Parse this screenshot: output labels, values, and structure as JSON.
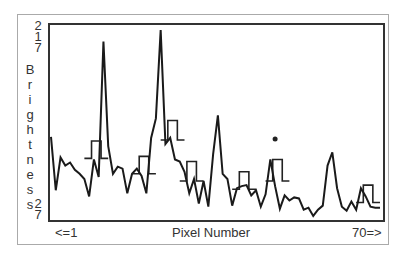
{
  "chart_data": {
    "type": "line",
    "title": "",
    "xlabel": "Pixel Number",
    "ylabel": "Brightness",
    "x_range_labels": {
      "min": "<=1",
      "max": "70=>"
    },
    "y_range_labels": {
      "max": "217",
      "min": "27"
    },
    "ylim": [
      27,
      217
    ],
    "xlim": [
      1,
      70
    ],
    "grid": false,
    "legend": null,
    "series": [
      {
        "name": "brightness",
        "x": [
          1,
          2,
          3,
          4,
          5,
          6,
          7,
          8,
          9,
          10,
          11,
          12,
          13,
          14,
          15,
          16,
          17,
          18,
          19,
          20,
          21,
          22,
          23,
          24,
          25,
          26,
          27,
          28,
          29,
          30,
          31,
          32,
          33,
          34,
          35,
          36,
          37,
          38,
          39,
          40,
          41,
          42,
          43,
          44,
          45,
          46,
          47,
          48,
          49,
          50,
          51,
          52,
          53,
          54,
          55,
          56,
          57,
          58,
          59,
          60,
          61,
          62,
          63,
          64,
          65,
          66,
          67,
          68,
          69,
          70
        ],
        "values": [
          108,
          56,
          88,
          80,
          83,
          76,
          72,
          67,
          50,
          86,
          69,
          201,
          99,
          72,
          79,
          77,
          53,
          72,
          77,
          70,
          53,
          107,
          126,
          212,
          101,
          107,
          86,
          84,
          74,
          53,
          67,
          43,
          65,
          40,
          91,
          129,
          72,
          67,
          41,
          58,
          60,
          61,
          51,
          56,
          40,
          52,
          86,
          60,
          38,
          51,
          46,
          49,
          48,
          37,
          39,
          31,
          37,
          41,
          80,
          93,
          58,
          40,
          36,
          45,
          37,
          58,
          50,
          40,
          39,
          39
        ]
      }
    ],
    "step_windows": [
      {
        "x_start": 8,
        "x_end": 13,
        "base": 87,
        "top": 104
      },
      {
        "x_start": 18,
        "x_end": 23,
        "base": 72,
        "top": 89
      },
      {
        "x_start": 24,
        "x_end": 29,
        "base": 105,
        "top": 124
      },
      {
        "x_start": 28,
        "x_end": 33,
        "base": 65,
        "top": 84
      },
      {
        "x_start": 39,
        "x_end": 44,
        "base": 57,
        "top": 74
      },
      {
        "x_start": 46,
        "x_end": 51,
        "base": 65,
        "top": 86
      },
      {
        "x_start": 65,
        "x_end": 70,
        "base": 44,
        "top": 61
      }
    ],
    "annotations": [
      {
        "type": "dot",
        "x": 48,
        "y": 106
      }
    ]
  },
  "labels": {
    "y_max_digits": [
      "2",
      "1",
      "7"
    ],
    "y_min_digits": [
      "2",
      "7"
    ],
    "y_title_letters": [
      "B",
      "r",
      "i",
      "g",
      "h",
      "t",
      "n",
      "e",
      "s",
      "s"
    ],
    "x_min": "<=1",
    "x_title": "Pixel Number",
    "x_max": "70=>"
  }
}
